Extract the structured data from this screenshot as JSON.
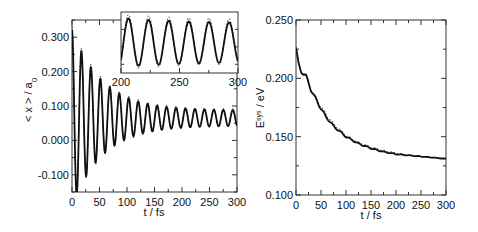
{
  "chart_data": [
    {
      "type": "line",
      "title": "",
      "xlabel": "t / fs",
      "ylabel": "< x > / a0",
      "ylabel_main": "< x > / a",
      "ylabel_sub": "0",
      "xlim": [
        0,
        300
      ],
      "ylim": [
        -0.15,
        0.35
      ],
      "xticks": [
        0,
        50,
        100,
        150,
        200,
        250,
        300
      ],
      "xtick_labels": [
        "0",
        "50",
        "100",
        "150",
        "200",
        "250",
        "300"
      ],
      "yticks": [
        -0.1,
        0.0,
        0.1,
        0.2,
        0.3
      ],
      "ytick_labels": [
        "-0.100",
        "0.000",
        "0.100",
        "0.200",
        "0.300"
      ],
      "grid": false,
      "series": [
        {
          "name": "exact (solid)",
          "style": "solid",
          "model": "damped_cosine",
          "params": {
            "offset": 0.065,
            "amp0": 0.235,
            "decay_fs": 55,
            "amp_inf": 0.022,
            "period_fs": 17.2
          },
          "x": [
            0,
            8,
            17,
            26,
            34,
            43,
            52,
            60,
            69,
            78,
            86,
            95,
            103,
            112,
            121,
            129,
            138,
            146,
            155,
            164,
            172,
            181,
            189,
            198,
            207,
            215,
            224,
            232,
            241,
            250,
            258,
            267,
            275,
            284,
            293,
            300
          ],
          "values": [
            0.3,
            -0.1,
            0.26,
            -0.075,
            0.22,
            -0.05,
            0.19,
            -0.03,
            0.17,
            -0.01,
            0.15,
            0.005,
            0.135,
            0.015,
            0.125,
            0.022,
            0.118,
            0.028,
            0.11,
            0.032,
            0.105,
            0.035,
            0.1,
            0.038,
            0.095,
            0.04,
            0.092,
            0.042,
            0.09,
            0.043,
            0.088,
            0.044,
            0.087,
            0.045,
            0.086,
            0.07
          ]
        },
        {
          "name": "approximate (dotted)",
          "style": "dotted",
          "model": "damped_cosine",
          "params": {
            "offset": 0.066,
            "amp0": 0.24,
            "decay_fs": 56,
            "amp_inf": 0.025,
            "period_fs": 17.2
          }
        }
      ],
      "inset": {
        "xlim": [
          200,
          300
        ],
        "xticks": [
          200,
          250,
          300
        ],
        "xtick_labels": [
          "200",
          "250",
          "300"
        ],
        "description": "zoom of t = 200-300 fs"
      }
    },
    {
      "type": "line",
      "title": "",
      "xlabel": "t / fs",
      "ylabel": "E^sys / eV",
      "ylabel_main": "E",
      "ylabel_sup": "sys",
      "ylabel_rest": " / eV",
      "xlim": [
        0,
        300
      ],
      "ylim": [
        0.1,
        0.25
      ],
      "xticks": [
        0,
        50,
        100,
        150,
        200,
        250,
        300
      ],
      "xtick_labels": [
        "0",
        "50",
        "100",
        "150",
        "200",
        "250",
        "300"
      ],
      "yticks": [
        0.1,
        0.15,
        0.2,
        0.25
      ],
      "ytick_labels": [
        "0.100",
        "0.150",
        "0.200",
        "0.250"
      ],
      "grid": false,
      "series": [
        {
          "name": "exact (solid)",
          "style": "solid",
          "x": [
            0,
            5,
            10,
            20,
            30,
            40,
            50,
            60,
            75,
            100,
            125,
            150,
            175,
            200,
            225,
            250,
            275,
            300
          ],
          "values": [
            0.226,
            0.212,
            0.206,
            0.202,
            0.19,
            0.182,
            0.174,
            0.167,
            0.159,
            0.15,
            0.144,
            0.14,
            0.137,
            0.135,
            0.134,
            0.133,
            0.132,
            0.131
          ]
        },
        {
          "name": "approximate (dotted)",
          "style": "dotted",
          "x": [
            0,
            5,
            10,
            20,
            30,
            40,
            50,
            60,
            75,
            100,
            125,
            150,
            175,
            200,
            225,
            250,
            275,
            300
          ],
          "values": [
            0.227,
            0.213,
            0.207,
            0.203,
            0.191,
            0.183,
            0.176,
            0.169,
            0.161,
            0.151,
            0.145,
            0.141,
            0.138,
            0.136,
            0.134,
            0.133,
            0.132,
            0.131
          ]
        }
      ]
    }
  ]
}
